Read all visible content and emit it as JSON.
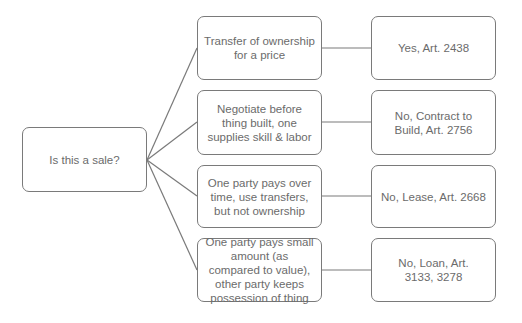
{
  "diagram": {
    "type": "tree",
    "colors": {
      "border": "#7a7a7a",
      "text": "#6b6b6b",
      "line": "#7a7a7a",
      "background": "#ffffff"
    },
    "root": {
      "label": "Is this a sale?"
    },
    "branches": [
      {
        "condition": "Transfer of ownership for a price",
        "result": "Yes, Art. 2438"
      },
      {
        "condition": "Negotiate before thing built, one supplies skill & labor",
        "result": "No, Contract to Build, Art. 2756"
      },
      {
        "condition": "One party pays over time, use transfers, but not ownership",
        "result": "No, Lease, Art. 2668"
      },
      {
        "condition": "One party pays small amount (as compared to value), other party keeps possession of thing",
        "result": "No, Loan, Art. 3133, 3278"
      }
    ]
  }
}
